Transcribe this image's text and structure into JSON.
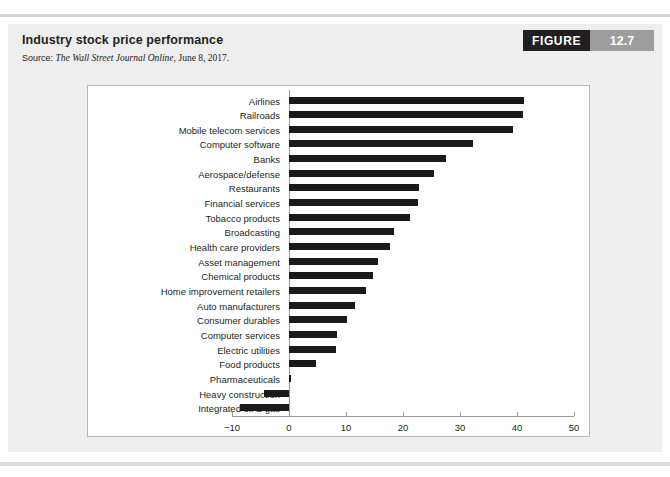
{
  "figure": {
    "title": "Industry stock price performance",
    "source_label": "Source:",
    "source_publication": "The Wall Street Journal Online,",
    "source_date": "June 8, 2017.",
    "badge_word": "FIGURE",
    "badge_number": "12.7"
  },
  "colors": {
    "card_background": "#eeeeee",
    "plot_background": "#ffffff",
    "bar": "#1a1a1a",
    "axis": "#9a9a9a",
    "badge_dark": "#231f20",
    "badge_gray": "#9d9d9d",
    "text": "#231f20"
  },
  "chart_data": {
    "type": "bar",
    "orientation": "horizontal",
    "title": "Industry stock price performance",
    "xlabel": "",
    "ylabel": "",
    "xlim": [
      -10,
      50
    ],
    "xticks": [
      -10,
      0,
      10,
      20,
      30,
      40,
      50
    ],
    "xtick_labels": [
      "−10",
      "0",
      "10",
      "20",
      "30",
      "40",
      "50"
    ],
    "grid": false,
    "legend": false,
    "categories": [
      "Airlines",
      "Railroads",
      "Mobile telecom services",
      "Computer software",
      "Banks",
      "Aerospace/defense",
      "Restaurants",
      "Financial services",
      "Tobacco products",
      "Broadcasting",
      "Health care providers",
      "Asset management",
      "Chemical products",
      "Home improvement retailers",
      "Auto manufacturers",
      "Consumer durables",
      "Computer services",
      "Electric utilities",
      "Food products",
      "Pharmaceuticals",
      "Heavy construction",
      "Integrated oil & gas"
    ],
    "values": [
      41.2,
      41.0,
      39.3,
      32.3,
      27.5,
      25.4,
      22.8,
      22.7,
      21.2,
      18.4,
      17.7,
      15.6,
      14.7,
      13.5,
      11.6,
      10.2,
      8.4,
      8.2,
      4.7,
      0.3,
      -4.4,
      -8.6
    ]
  }
}
